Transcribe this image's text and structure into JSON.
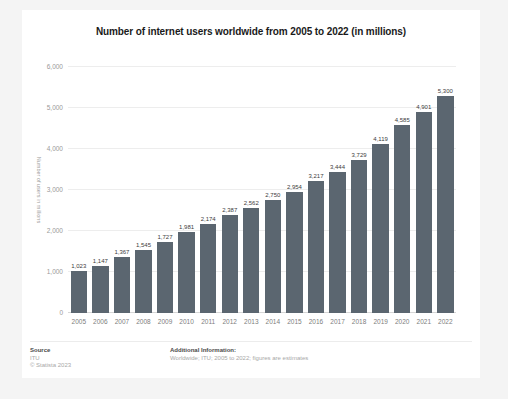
{
  "chart_data": {
    "type": "bar",
    "title": "Number of internet users worldwide from 2005 to 2022 (in millions)",
    "xlabel": "",
    "ylabel": "Number of users in millions",
    "ylim": [
      0,
      6000
    ],
    "yticks": [
      "0",
      "1,000",
      "2,000",
      "3,000",
      "4,000",
      "5,000",
      "6,000"
    ],
    "ytick_values": [
      0,
      1000,
      2000,
      3000,
      4000,
      5000,
      6000
    ],
    "grid": true,
    "legend": false,
    "bar_color": "#5b6670",
    "categories": [
      "2005",
      "2006",
      "2007",
      "2008",
      "2009",
      "2010",
      "2011",
      "2012",
      "2013",
      "2014",
      "2015",
      "2016",
      "2017",
      "2018",
      "2019",
      "2020",
      "2021",
      "2022"
    ],
    "values": [
      1023,
      1147,
      1367,
      1545,
      1727,
      1981,
      2174,
      2387,
      2562,
      2750,
      2954,
      3217,
      3444,
      3729,
      4119,
      4585,
      4901,
      5300
    ],
    "value_labels": [
      "1,023",
      "1,147",
      "1,367",
      "1,545",
      "1,727",
      "1,981",
      "2,174",
      "2,387",
      "2,562",
      "2,750",
      "2,954",
      "3,217",
      "3,444",
      "3,729",
      "4,119",
      "4,585",
      "4,901",
      "5,300"
    ]
  },
  "footer": {
    "source_heading": "Source",
    "source_name": "ITU",
    "copyright": "© Statista 2023",
    "notes_heading": "Additional Information:",
    "notes_text": "Worldwide; ITU; 2005 to 2022; figures are estimates"
  }
}
